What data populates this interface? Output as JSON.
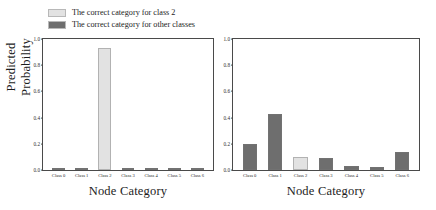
{
  "legend": {
    "items": [
      {
        "label": "The correct category for class 2",
        "color": "#e2e2e2",
        "icon": "legend-swatch-light"
      },
      {
        "label": "The correct category for other classes",
        "color": "#6e6e6e",
        "icon": "legend-swatch-dark"
      }
    ]
  },
  "axis": {
    "ylabel": "Predicted Probability",
    "xlabel": "Node Category",
    "yticks": [
      "1.0",
      "0.8",
      "0.6",
      "0.4",
      "0.2",
      "0.0"
    ],
    "ytick_values": [
      1.0,
      0.8,
      0.6,
      0.4,
      0.2,
      0.0
    ]
  },
  "colors": {
    "light_bar": "#e2e2e2",
    "dark_bar": "#6e6e6e",
    "axis": "#4a4a4a",
    "text": "#1c1c1c",
    "background": "#ffffff"
  },
  "chart_data": [
    {
      "type": "bar",
      "panel": "left",
      "title": "",
      "xlabel": "Node Category",
      "ylabel": "Predicted Probability",
      "categories": [
        "Class 0",
        "Class 1",
        "Class 2",
        "Class 3",
        "Class 4",
        "Class 5",
        "Class 6"
      ],
      "values": [
        0.015,
        0.005,
        0.93,
        0.006,
        0.006,
        0.005,
        0.006
      ],
      "bar_colors": [
        "#6e6e6e",
        "#6e6e6e",
        "#e2e2e2",
        "#6e6e6e",
        "#6e6e6e",
        "#6e6e6e",
        "#6e6e6e"
      ],
      "ylim": [
        0.0,
        1.0
      ],
      "grid": false,
      "legend_position": "above-figure"
    },
    {
      "type": "bar",
      "panel": "right",
      "title": "",
      "xlabel": "Node Category",
      "ylabel": "",
      "categories": [
        "Class 0",
        "Class 1",
        "Class 2",
        "Class 3",
        "Class 4",
        "Class 5",
        "Class 6"
      ],
      "values": [
        0.2,
        0.43,
        0.1,
        0.09,
        0.03,
        0.02,
        0.14
      ],
      "bar_colors": [
        "#6e6e6e",
        "#6e6e6e",
        "#e2e2e2",
        "#6e6e6e",
        "#6e6e6e",
        "#6e6e6e",
        "#6e6e6e"
      ],
      "ylim": [
        0.0,
        1.0
      ],
      "grid": false,
      "legend_position": "above-figure"
    }
  ]
}
